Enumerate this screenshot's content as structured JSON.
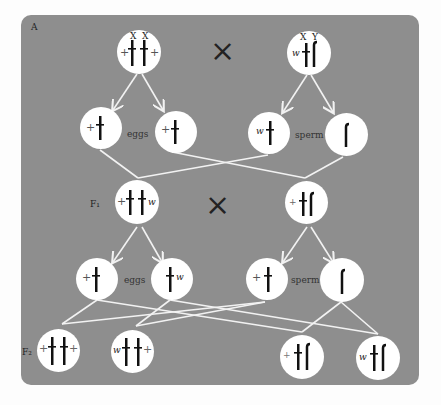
{
  "panel_label": "A",
  "labels": {
    "eggs": "eggs",
    "sperm": "sperm",
    "f1": "F₁",
    "f2": "F₂",
    "cross": "×"
  },
  "parents": {
    "female": {
      "chromosomes": [
        "X",
        "X"
      ],
      "alleles": [
        "+",
        "+"
      ]
    },
    "male": {
      "chromosomes": [
        "X",
        "Y"
      ],
      "alleles": [
        "w",
        ""
      ]
    }
  },
  "p_gametes": {
    "eggs": [
      {
        "allele": "+",
        "chrom": "X"
      },
      {
        "allele": "+",
        "chrom": "X"
      }
    ],
    "sperm": [
      {
        "allele": "w",
        "chrom": "X"
      },
      {
        "allele": "",
        "chrom": "Y"
      }
    ]
  },
  "f1": {
    "female": {
      "alleles": [
        "+",
        "w"
      ],
      "chromosomes": [
        "X",
        "X"
      ]
    },
    "male": {
      "alleles": [
        "+",
        ""
      ],
      "chromosomes": [
        "X",
        "Y"
      ]
    }
  },
  "f1_gametes": {
    "eggs": [
      {
        "allele": "+",
        "chrom": "X"
      },
      {
        "allele": "w",
        "chrom": "X"
      }
    ],
    "sperm": [
      {
        "allele": "+",
        "chrom": "X"
      },
      {
        "allele": "",
        "chrom": "Y"
      }
    ]
  },
  "f2": [
    {
      "genotype": "+/+",
      "alleles": [
        "+",
        "+"
      ],
      "chromosomes": [
        "X",
        "X"
      ]
    },
    {
      "genotype": "w/+",
      "alleles": [
        "w",
        "+"
      ],
      "chromosomes": [
        "X",
        "X"
      ]
    },
    {
      "genotype": "+/Y",
      "alleles": [
        "+",
        ""
      ],
      "chromosomes": [
        "X",
        "Y"
      ]
    },
    {
      "genotype": "w/Y",
      "alleles": [
        "w",
        ""
      ],
      "chromosomes": [
        "X",
        "Y"
      ]
    }
  ],
  "colors": {
    "panel": "#8e8e8e",
    "circle": "#ffffff",
    "wire": "#f2f2f2",
    "chromosome": "#111111"
  }
}
